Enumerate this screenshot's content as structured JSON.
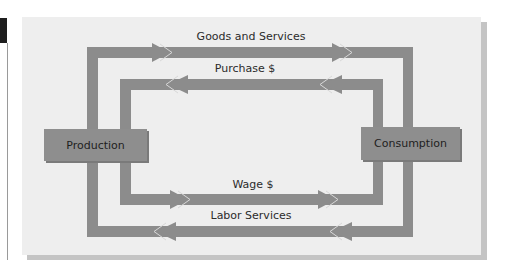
{
  "diagram": {
    "type": "circular-flow",
    "nodes": {
      "left": "Production",
      "right": "Consumption"
    },
    "flows": [
      {
        "label": "Goods and Services",
        "direction": "production-to-consumption",
        "loop": "outer-top"
      },
      {
        "label": "Purchase $",
        "direction": "consumption-to-production",
        "loop": "inner-top"
      },
      {
        "label": "Wage $",
        "direction": "production-to-consumption",
        "loop": "inner-bottom"
      },
      {
        "label": "Labor Services",
        "direction": "consumption-to-production",
        "loop": "outer-bottom"
      }
    ],
    "colors": {
      "panel": "#eeeeee",
      "band": "#8c8c8c",
      "box": "#8e8e8e",
      "text": "#2b2b2b"
    }
  }
}
